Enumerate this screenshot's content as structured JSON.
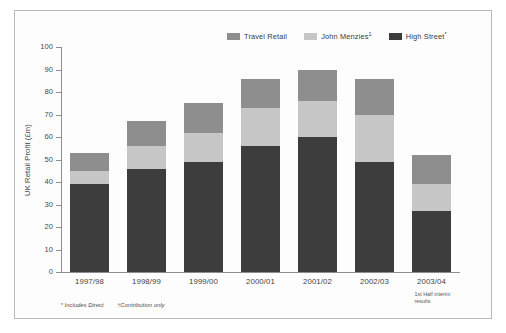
{
  "chart_data": {
    "type": "bar",
    "subtype": "stacked-vertical",
    "title": "",
    "xlabel": "",
    "ylabel": "UK Retail Profit (£m)",
    "ylim": [
      0,
      100
    ],
    "ytick_step": 10,
    "yticks": [
      100,
      90,
      80,
      70,
      60,
      50,
      40,
      30,
      20,
      10,
      0
    ],
    "grid": false,
    "legend_position": "top-right",
    "categories": [
      "1997/98",
      "1998/99",
      "1999/00",
      "2000/01",
      "2001/02",
      "2002/03",
      "2003/04"
    ],
    "category_sublabels": [
      "",
      "",
      "",
      "",
      "",
      "",
      "1st Half interim results"
    ],
    "series": [
      {
        "name": "High Street*",
        "legend_label": "High Street",
        "legend_sup": "*",
        "color": "#3d3d3d",
        "values": [
          39,
          46,
          49,
          56,
          60,
          49,
          27
        ]
      },
      {
        "name": "John Menzies†",
        "legend_label": "John Menzies",
        "legend_sup": "1",
        "color": "#c6c6c6",
        "values": [
          6,
          10,
          13,
          17,
          16,
          21,
          12
        ]
      },
      {
        "name": "Travel Retail",
        "legend_label": "Travel Retail",
        "legend_sup": "",
        "color": "#8e8e8e",
        "values": [
          8,
          11,
          13,
          13,
          14,
          16,
          13
        ]
      }
    ],
    "totals": [
      53,
      67,
      75,
      86,
      90,
      86,
      52
    ],
    "stack_order_bottom_to_top": [
      "High Street*",
      "John Menzies†",
      "Travel Retail"
    ],
    "annotations": [
      {
        "mark": "*",
        "text": "Includes Direct"
      },
      {
        "mark": "†",
        "text": "Contribution only"
      }
    ]
  },
  "footnotes": {
    "first_mark": "*",
    "first_text": "Includes Direct",
    "second_mark": "†",
    "second_text": "Contribution only"
  }
}
